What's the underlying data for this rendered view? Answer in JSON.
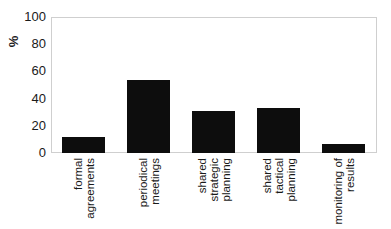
{
  "chart_data": {
    "type": "bar",
    "title": "",
    "xlabel": "",
    "ylabel": "%",
    "ylim": [
      0,
      100
    ],
    "yticks": [
      0,
      20,
      40,
      60,
      80,
      100
    ],
    "grid": false,
    "legend": null,
    "categories": [
      "formal agreements",
      "periodical meetings",
      "shared strategic planning",
      "shared tactical planning",
      "monitoring of results"
    ],
    "category_label_lines": [
      [
        "formal",
        "agreements"
      ],
      [
        "periodical",
        "meetings"
      ],
      [
        "shared",
        "strategic",
        "planning"
      ],
      [
        "shared",
        "tactical",
        "planning"
      ],
      [
        "monitoring of",
        "results"
      ]
    ],
    "values": [
      12,
      54,
      31,
      33,
      6.5
    ],
    "bar_color": "#0d0d0d"
  }
}
